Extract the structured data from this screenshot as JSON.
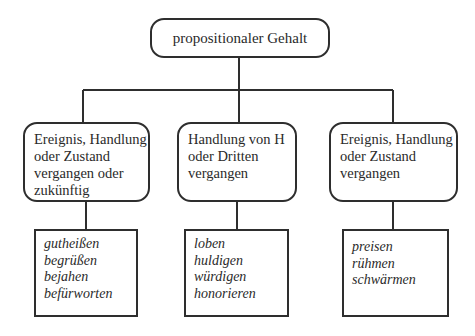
{
  "diagram": {
    "root": {
      "label": "propositionaler Gehalt"
    },
    "branches": [
      {
        "category_lines": [
          "Ereignis, Handlung",
          "oder Zustand",
          "vergangen oder",
          "zukünftig"
        ],
        "verbs": [
          "gutheißen",
          "begrüßen",
          "bejahen",
          "befürworten"
        ]
      },
      {
        "category_lines": [
          "Handlung von H",
          "oder Dritten",
          "vergangen"
        ],
        "verbs": [
          "loben",
          "huldigen",
          "würdigen",
          "honorieren"
        ]
      },
      {
        "category_lines": [
          "Ereignis, Handlung",
          "oder Zustand",
          "vergangen"
        ],
        "verbs": [
          "preisen",
          "rühmen",
          "schwärmen"
        ]
      }
    ]
  }
}
